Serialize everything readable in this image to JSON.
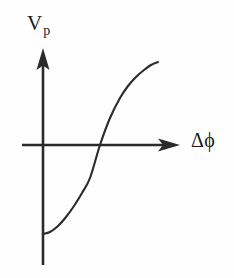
{
  "figure": {
    "background_color": "#fefefe",
    "ink_color": "#2b2b2b",
    "width": 234,
    "height": 278
  },
  "axes": {
    "y_label_main": "V",
    "y_label_sub": "p",
    "x_label": "Δϕ",
    "y_axis_x": 43,
    "y_axis_top": 48,
    "y_axis_bottom": 265,
    "x_axis_y": 145,
    "x_axis_left": 22,
    "x_axis_right": 180,
    "arrow_style": "solid-triangle"
  },
  "chart_data": {
    "type": "line",
    "title": "",
    "xlabel": "Δϕ",
    "ylabel": "V_p",
    "grid": false,
    "legend": "none",
    "axis_arrows": true,
    "tick_labels": [],
    "xlim": [
      22,
      180
    ],
    "ylim": [
      265,
      48
    ],
    "series": [
      {
        "name": "phase-detector-characteristic",
        "x": [
          43,
          50,
          58,
          66,
          74,
          82,
          90,
          100,
          110,
          120,
          128,
          136,
          144,
          151,
          158
        ],
        "y": [
          234,
          232,
          226,
          217,
          206,
          193,
          178,
          145,
          118,
          98,
          86,
          77,
          70,
          65,
          62
        ],
        "x_axis_crossing": [
          100,
          145
        ],
        "left_plateau_point": [
          43,
          234
        ],
        "right_plateau_point": [
          158,
          62
        ]
      }
    ]
  }
}
